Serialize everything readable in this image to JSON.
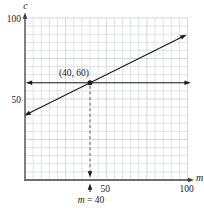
{
  "figure": {
    "background": "#ffffff",
    "ink": "#1c1c1c",
    "grid_color": "#d6d7dd",
    "grid_major_color": "#c6c7d0",
    "axis_color": "#3a3a3a",
    "x_axis_color": "#6f6f6f",
    "dash_color": "#5f5f5f"
  },
  "chart_data": {
    "type": "line",
    "title": "",
    "xlabel": "m",
    "ylabel": "c",
    "xlim": [
      0,
      100
    ],
    "ylim": [
      0,
      100
    ],
    "grid": {
      "show": true,
      "step": 5,
      "major_every": 5
    },
    "x_ticks": [
      {
        "value": 50,
        "label": "50"
      },
      {
        "value": 100,
        "label": "100"
      }
    ],
    "y_ticks": [
      {
        "value": 50,
        "label": "50"
      },
      {
        "value": 100,
        "label": "100"
      }
    ],
    "series": [
      {
        "name": "cost-line",
        "equation": "c = 0.5m + 40",
        "slope": 0.5,
        "intercept": 40,
        "x_range": [
          0.5,
          98.5
        ],
        "arrows": "both",
        "points": [
          {
            "m": 0,
            "c": 40
          },
          {
            "m": 40,
            "c": 60
          },
          {
            "m": 100,
            "c": 90
          }
        ]
      },
      {
        "name": "level-line",
        "equation": "c = 60",
        "c": 60,
        "x_range": [
          1.5,
          101
        ],
        "arrows": "both"
      }
    ],
    "marked_point": {
      "m": 40,
      "c": 60,
      "label": "(40, 60)"
    },
    "drop_line": {
      "m": 40,
      "c_top": 60,
      "dashed": true,
      "arrow": "down"
    },
    "callout": {
      "italic_part": "m",
      "rest_part": " = 40",
      "points_to_m": 40
    }
  }
}
